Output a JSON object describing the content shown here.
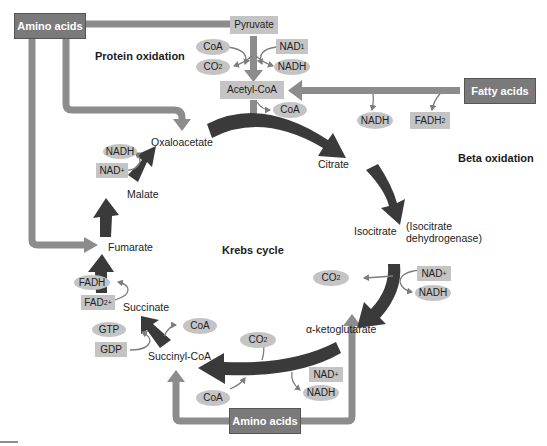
{
  "title": "Krebs cycle",
  "colors": {
    "dark_arrow": "#3a3a3a",
    "grey_arrow": "#8c8c8c",
    "box_dark": "#7a7a7a",
    "tag_fill": "#c4c4c4",
    "text": "#222222"
  },
  "sources": {
    "amino_acids_top": "Amino acids",
    "amino_acids_bottom": "Amino acids",
    "fatty_acids": "Fatty acids"
  },
  "section_labels": {
    "protein_oxidation": "Protein oxidation",
    "beta_oxidation": "Beta oxidation",
    "krebs_cycle": "Krebs cycle"
  },
  "pyruvate_step": {
    "pyruvate": "Pyruvate",
    "coa_in": "CoA",
    "co2_out": {
      "base": "CO",
      "sub": "2"
    },
    "nad_in": {
      "base": "NAD",
      "sup": "1"
    },
    "nadh_out": "NADH",
    "acetyl_coa": "Acetyl-CoA",
    "coa_out": "CoA"
  },
  "beta_oxidation_products": {
    "nadh": "NADH",
    "fadh2": {
      "base": "FADH",
      "sub": "2"
    }
  },
  "intermediates": {
    "oxaloacetate": "Oxaloacetate",
    "citrate": "Citrate",
    "isocitrate": "Isocitrate",
    "isocitrate_enzyme_line1": "(Isocitrate",
    "isocitrate_enzyme_line2": "dehydrogenase)",
    "alpha_ketoglutarate": "α-ketoglutarate",
    "succinyl_coa": "Succinyl-CoA",
    "succinate": "Succinate",
    "fumarate": "Fumarate",
    "malate": "Malate"
  },
  "cofactors": {
    "isocitrate_step": {
      "co2": {
        "base": "CO",
        "sub": "2"
      },
      "nad": {
        "base": "NAD",
        "sup": "+"
      },
      "nadh": "NADH"
    },
    "akg_step": {
      "co2": {
        "base": "CO",
        "sub": "2"
      },
      "nad": {
        "base": "NAD",
        "sup": "+"
      },
      "nadh": "NADH",
      "coa": "CoA"
    },
    "succinyl_step": {
      "gtp": "GTP",
      "gdp": "GDP",
      "coa": "CoA"
    },
    "succinate_step": {
      "fadh": "FADH",
      "fad": {
        "base": "FAD",
        "sup": "2+"
      }
    },
    "malate_step": {
      "nadh": "NADH",
      "nad": {
        "base": "NAD",
        "sup": "+"
      }
    }
  }
}
